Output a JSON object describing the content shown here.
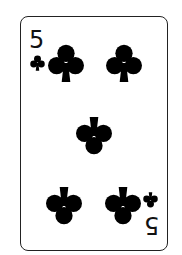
{
  "card": {
    "rank": "5",
    "suit": "clubs",
    "suit_color": "#000000",
    "pip_count": 5,
    "index_top": {
      "rank": "5",
      "suit_icon": "club-icon"
    },
    "index_bottom": {
      "rank": "5",
      "suit_icon": "club-icon",
      "rotated": true
    }
  }
}
